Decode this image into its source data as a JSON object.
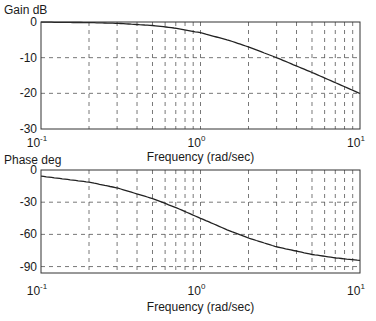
{
  "chart_data": [
    {
      "type": "line",
      "title": "Gain dB",
      "xlabel": "Frequency (rad/sec)",
      "ylabel": "Gain dB",
      "xscale": "log",
      "xlim": [
        0.1,
        10
      ],
      "ylim": [
        -30,
        0
      ],
      "grid": true,
      "xticks": [
        {
          "base": "10",
          "exp": "-1"
        },
        {
          "base": "10",
          "exp": "0"
        },
        {
          "base": "10",
          "exp": "1"
        }
      ],
      "yticks": [
        "0",
        "-10",
        "-20",
        "-30"
      ],
      "ytick_values": [
        0,
        -10,
        -20,
        -30
      ],
      "series": [
        {
          "name": "gain",
          "x": [
            0.1,
            0.2,
            0.3,
            0.5,
            0.7,
            1.0,
            1.5,
            2.0,
            3.0,
            5.0,
            7.0,
            10.0
          ],
          "values": [
            -0.04,
            -0.17,
            -0.37,
            -0.97,
            -1.73,
            -3.01,
            -5.12,
            -6.99,
            -10.0,
            -14.15,
            -17.0,
            -20.04
          ]
        }
      ]
    },
    {
      "type": "line",
      "title": "Phase deg",
      "xlabel": "Frequency (rad/sec)",
      "ylabel": "Phase deg",
      "xscale": "log",
      "xlim": [
        0.1,
        10
      ],
      "ylim": [
        -96,
        0
      ],
      "grid": true,
      "xticks": [
        {
          "base": "10",
          "exp": "-1"
        },
        {
          "base": "10",
          "exp": "0"
        },
        {
          "base": "10",
          "exp": "1"
        }
      ],
      "yticks": [
        "0",
        "-30",
        "-60",
        "-90"
      ],
      "ytick_values": [
        0,
        -30,
        -60,
        -90
      ],
      "series": [
        {
          "name": "phase",
          "x": [
            0.1,
            0.2,
            0.3,
            0.5,
            0.7,
            1.0,
            1.5,
            2.0,
            3.0,
            5.0,
            7.0,
            10.0
          ],
          "values": [
            -5.7,
            -11.3,
            -16.7,
            -26.6,
            -35.0,
            -45.0,
            -56.3,
            -63.4,
            -71.6,
            -78.7,
            -81.9,
            -84.3
          ]
        }
      ]
    }
  ]
}
